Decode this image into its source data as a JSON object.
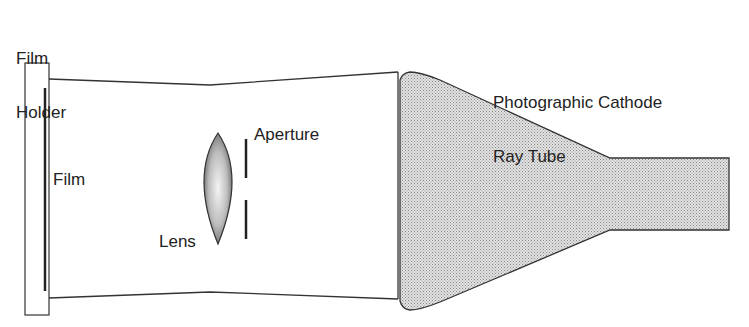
{
  "diagram": {
    "labels": {
      "film_holder_line1": "Film",
      "film_holder_line2": "Holder",
      "film": "Film",
      "lens": "Lens",
      "aperture": "Aperture",
      "crt_line1": "Photographic Cathode",
      "crt_line2": "Ray Tube"
    },
    "colors": {
      "stroke": "#333333",
      "crt_fill": "#c8c8c8",
      "background": "#ffffff"
    }
  }
}
